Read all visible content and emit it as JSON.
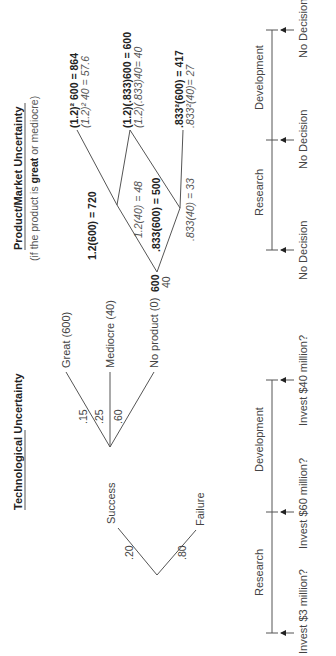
{
  "tech": {
    "title": "Technological Uncertainty",
    "root_branches": [
      {
        "prob": ".20",
        "label": "Success"
      },
      {
        "prob": ".80",
        "label": "Failure"
      }
    ],
    "success_branches": [
      {
        "prob": ".15",
        "label": "Great (600)"
      },
      {
        "prob": ".25",
        "label": "Mediocre (40)"
      },
      {
        "prob": ".60",
        "label": "No product (0)"
      }
    ],
    "timeline": {
      "phases": [
        "Research",
        "Development"
      ],
      "decisions": [
        "Invest $3 million?",
        "Invest $60 million?",
        "Invest $40 million?"
      ]
    }
  },
  "market": {
    "title": "Product/Market Uncertainty",
    "subtitle_pre": "(if the product is ",
    "subtitle_bold": "great",
    "subtitle_post": " or mediocre)",
    "root": {
      "great": "600",
      "mediocre": "40"
    },
    "mid_nodes": [
      {
        "bold": "1.2(600) = 720",
        "italic": "1.2(40) = 48"
      },
      {
        "bold": ".833(600) = 500",
        "italic": ".833(40) = 33"
      }
    ],
    "end_nodes": [
      {
        "bold": "(1.2)² 600 = 864",
        "italic": "(1.2)² 40 = 57.6"
      },
      {
        "bold": "(1.2)(.833)600 = 600",
        "italic": "(1.2)(.833)40= 40"
      },
      {
        "bold": ".833²(600) = 417",
        "italic": ".833²(40)= 27"
      }
    ],
    "timeline": {
      "phases": [
        "Research",
        "Development"
      ],
      "decisions": [
        "No Decision",
        "No Decision",
        "No Decision"
      ]
    }
  },
  "colors": {
    "line": "#555555",
    "text": "#444444",
    "background": "#ffffff"
  }
}
